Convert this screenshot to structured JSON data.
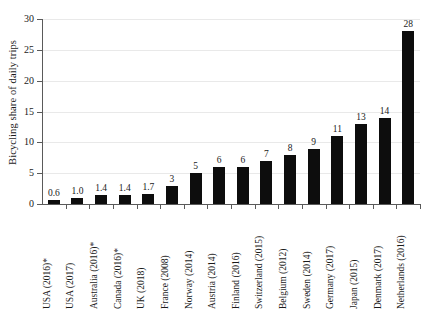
{
  "chart_data": {
    "type": "bar",
    "title": "",
    "xlabel": "",
    "ylabel": "Bicycling share of daily trips",
    "ylim": [
      0,
      30
    ],
    "yticks": [
      0,
      5,
      10,
      15,
      20,
      25,
      30
    ],
    "ytick_labels": [
      "0",
      "5",
      "10",
      "15",
      "20",
      "25",
      "30"
    ],
    "grid": true,
    "legend": null,
    "bar_color": "#0d0d0d",
    "gridline_color": "#e9e9e9",
    "axis_color": "#5a5a5a",
    "categories": [
      "USA (2016)*",
      "USA (2017)",
      "Australia (2016)*",
      "Canada (2016)*",
      "UK (2018)",
      "France (2008)",
      "Norway (2014)",
      "Austria (2014)",
      "Finland (2016)",
      "Switzerland (2015)",
      "Belgium (2012)",
      "Sweden (2014)",
      "Germany (2017)",
      "Japan (2015)",
      "Denmark (2017)",
      "Netherlands (2016)"
    ],
    "values": [
      0.6,
      1.0,
      1.4,
      1.4,
      1.7,
      3,
      5,
      6,
      6,
      7,
      8,
      9,
      11,
      13,
      14,
      28
    ],
    "value_labels": [
      "0.6",
      "1.0",
      "1.4",
      "1.4",
      "1.7",
      "3",
      "5",
      "6",
      "6",
      "7",
      "8",
      "9",
      "11",
      "13",
      "14",
      "28"
    ],
    "bar_pixel_heights": [
      4,
      7,
      9,
      9,
      11,
      19,
      31,
      37,
      40,
      44,
      51,
      57,
      72,
      82,
      88,
      175
    ]
  }
}
